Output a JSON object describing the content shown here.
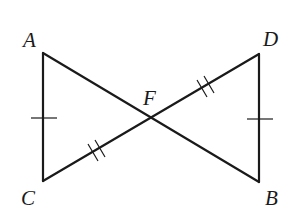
{
  "figure": {
    "type": "geometry-diagram",
    "points": {
      "A": {
        "label": "A",
        "x": 43,
        "y": 53
      },
      "C": {
        "label": "C",
        "x": 43,
        "y": 181
      },
      "F": {
        "label": "F",
        "x": 150,
        "y": 117
      },
      "D": {
        "label": "D",
        "x": 259,
        "y": 54
      },
      "B": {
        "label": "B",
        "x": 259,
        "y": 182
      }
    },
    "segments": [
      "AC",
      "AB",
      "CD",
      "DB"
    ],
    "congruence_marks": [
      {
        "segment": "AC",
        "ticks": 1
      },
      {
        "segment": "DB",
        "ticks": 1
      },
      {
        "segment": "CF",
        "ticks": 2
      },
      {
        "segment": "FD",
        "ticks": 2
      }
    ],
    "stroke_color": "#1a1a1a",
    "background": "#ffffff"
  }
}
